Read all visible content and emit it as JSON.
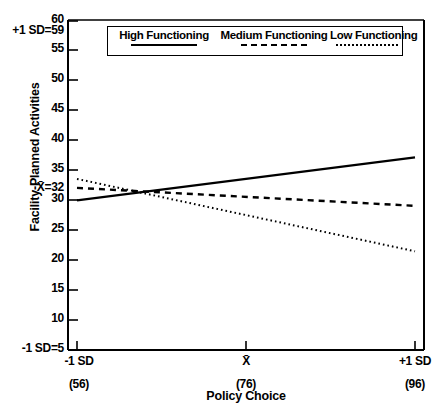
{
  "chart_data": {
    "type": "line",
    "title": "",
    "xlabel": "Policy Choice",
    "ylabel": "Facility-Planned Activities",
    "xlim": [
      56,
      96
    ],
    "ylim": [
      5,
      60
    ],
    "grid": false,
    "legend_position": "top-center",
    "x": [
      56,
      96
    ],
    "x_tick_labels": [
      "-1 SD",
      "X̄",
      "+1 SD"
    ],
    "x_tick_sublabels": [
      "(56)",
      "(76)",
      "(96)"
    ],
    "x_tick_values": [
      56,
      76,
      96
    ],
    "y_tick_values": [
      5,
      10,
      15,
      20,
      25,
      30,
      35,
      40,
      45,
      50,
      55,
      60
    ],
    "y_tick_labels": [
      "5",
      "10",
      "15",
      "20",
      "25",
      "30",
      "35",
      "40",
      "45",
      "50",
      "55",
      "60"
    ],
    "y_annotations": [
      {
        "label": "+1 SD=59",
        "value": 59
      },
      {
        "label": "X̄=32",
        "value": 32
      },
      {
        "label": "-1 SD=5",
        "value": 5
      }
    ],
    "series": [
      {
        "name": "High Functioning",
        "style": "solid",
        "values": [
          30.0,
          37.2
        ]
      },
      {
        "name": "Medium Functioning",
        "style": "dashed",
        "values": [
          32.1,
          29.1
        ]
      },
      {
        "name": "Low Functioning",
        "style": "dotted",
        "values": [
          33.6,
          21.5
        ]
      }
    ]
  },
  "axes": {
    "y_title": "Facility-Planned Activities",
    "x_title": "Policy Choice"
  },
  "legend": {
    "entries": [
      {
        "label": "High Functioning",
        "style": "solid"
      },
      {
        "label": "Medium Functioning",
        "style": "dashed"
      },
      {
        "label": "Low Functioning",
        "style": "dotted"
      }
    ]
  },
  "colors": {
    "line": "#000000",
    "background": "#ffffff",
    "axis": "#000000"
  }
}
